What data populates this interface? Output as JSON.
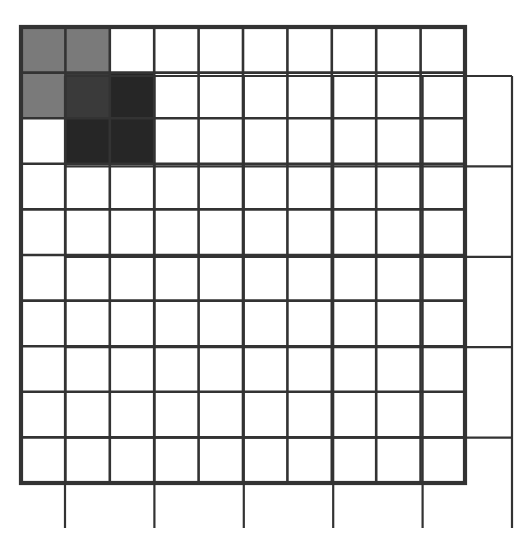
{
  "fine_grid": {
    "rows": 10,
    "cols": 10,
    "x0": 21,
    "y0": 27,
    "x1": 465,
    "y1": 483,
    "line_color": "#333333",
    "line_width": 2.6,
    "border_width": 4.2
  },
  "coarse_grid": {
    "rows": 5,
    "cols": 5,
    "x0": 65,
    "y0": 76,
    "x1": 512,
    "y1": 528,
    "line_color": "#333333",
    "line_width": 2.2,
    "bottom_line_start_x": 150
  },
  "shaded_cells": [
    {
      "row": 0,
      "col": 0,
      "color": "#7a7a7a",
      "label": "square-a"
    },
    {
      "row": 0,
      "col": 1,
      "color": "#7a7a7a",
      "label": "square-a"
    },
    {
      "row": 1,
      "col": 0,
      "color": "#7a7a7a",
      "label": "square-a"
    },
    {
      "row": 1,
      "col": 1,
      "color": "#3a3a3a",
      "label": "overlap"
    },
    {
      "row": 1,
      "col": 2,
      "color": "#262626",
      "label": "square-b"
    },
    {
      "row": 2,
      "col": 1,
      "color": "#262626",
      "label": "square-b"
    },
    {
      "row": 2,
      "col": 2,
      "color": "#262626",
      "label": "square-b"
    }
  ],
  "colors": {
    "background": "#ffffff",
    "square_a": "#7a7a7a",
    "overlap": "#3a3a3a",
    "square_b": "#262626"
  }
}
